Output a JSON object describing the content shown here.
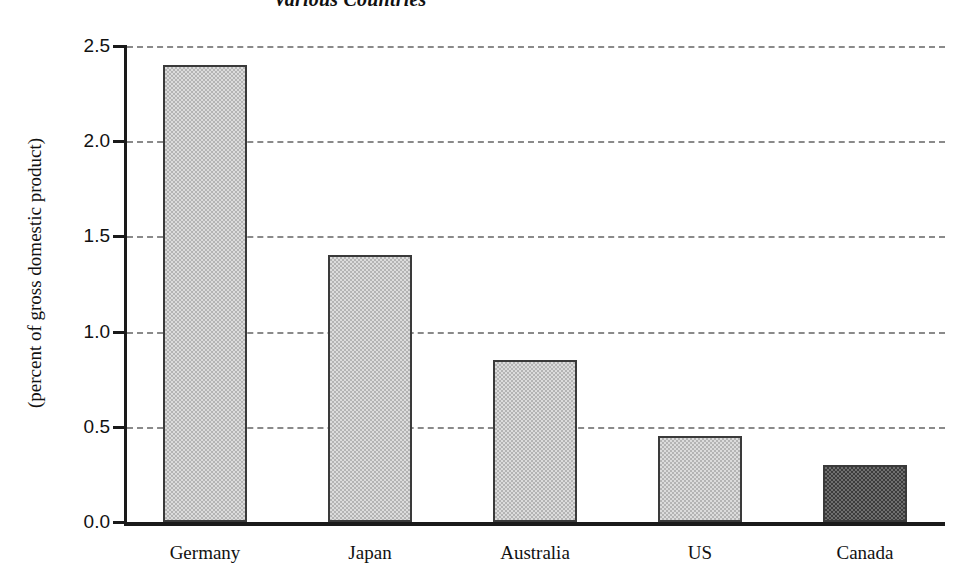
{
  "chart_data": {
    "type": "bar",
    "title": "Various Countries",
    "subtitle": "",
    "xlabel": "",
    "ylabel": "(percent of gross domestic product)",
    "categories": [
      "Germany",
      "Japan",
      "Australia",
      "US",
      "Canada"
    ],
    "values": [
      2.4,
      1.4,
      0.85,
      0.45,
      0.3
    ],
    "series": [
      {
        "name": "Percent of gross domestic product",
        "values": [
          2.4,
          1.4,
          0.85,
          0.45,
          0.3
        ]
      }
    ],
    "ylim": [
      0.0,
      2.5
    ],
    "ytick_labels": [
      "0.0",
      "0.5",
      "1.0",
      "1.5",
      "2.0",
      "2.5"
    ],
    "ytick_values": [
      0.0,
      0.5,
      1.0,
      1.5,
      2.0,
      2.5
    ],
    "grid": true,
    "grid_style": "dashed-horizontal",
    "legend": false,
    "legend_position": "none",
    "bar_styles": [
      "light-dither",
      "light-dither",
      "light-dither",
      "light-dither",
      "dark-dither"
    ],
    "highlight_category": "Canada",
    "colors": {
      "bar_light_fill": "#dcdcdc",
      "bar_light_pattern": "#b4b4b4",
      "bar_dark_fill": "#6f6f6f",
      "bar_dark_pattern": "#3c3c3c",
      "bar_border": "#3a3a3a",
      "axis": "#1a1a1a",
      "gridline": "#8a8a8a",
      "text": "#111111",
      "background": "#ffffff"
    }
  }
}
